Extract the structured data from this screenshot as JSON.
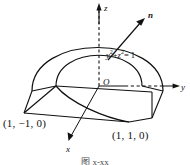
{
  "figure": {
    "background_color": "#ffffff",
    "stroke_color": "#111111",
    "caption": "图 x-xx",
    "axes": {
      "z_label": "z",
      "y_label": "y",
      "x_label": "x",
      "origin_label": "O"
    },
    "normal_vector": {
      "label": "n"
    },
    "surface_equation": {
      "lhs_first_var": "y",
      "lhs_first_exp": "2",
      "plus": "+",
      "lhs_second_var": "z",
      "lhs_second_exp": "2",
      "equals": "= 1"
    },
    "points": [
      {
        "name": "left-front-vertex",
        "label": "(1, −1, 0)"
      },
      {
        "name": "right-front-vertex",
        "label": "(1, 1, 0)"
      }
    ]
  }
}
